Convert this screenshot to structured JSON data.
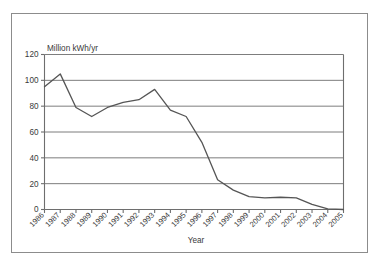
{
  "chart_data": {
    "type": "line",
    "title": "",
    "subtitle": "",
    "xlabel": "Year",
    "ylabel": "Million kWh/yr",
    "ylabel_position": "above-axis",
    "categories": [
      "1986",
      "1987",
      "1988",
      "1989",
      "1990",
      "1991",
      "1992",
      "1993",
      "1994",
      "1995",
      "1996",
      "1997",
      "1998",
      "1999",
      "2000",
      "2001",
      "2002",
      "2003",
      "2004",
      "2005"
    ],
    "values": [
      95,
      105,
      79,
      72,
      79,
      83,
      85,
      93,
      77,
      72,
      52,
      23,
      15,
      10,
      9,
      9.5,
      9,
      4,
      0.5,
      0
    ],
    "series": [
      {
        "name": "Electricity generation",
        "values": [
          95,
          105,
          79,
          72,
          79,
          83,
          85,
          93,
          77,
          72,
          52,
          23,
          15,
          10,
          9,
          9.5,
          9,
          4,
          0.5,
          0
        ],
        "color": "#555555"
      }
    ],
    "ylim": [
      0,
      120
    ],
    "yticks": [
      0,
      20,
      40,
      60,
      80,
      100,
      120
    ],
    "ytick_labels": [
      "0",
      "20",
      "40",
      "60",
      "80",
      "100",
      "120"
    ],
    "xtick_labels": [
      "1986",
      "1987",
      "1988",
      "1989",
      "1990",
      "1991",
      "1992",
      "1993",
      "1994",
      "1995",
      "1996",
      "1997",
      "1998",
      "1999",
      "2000",
      "2001",
      "2002",
      "2003",
      "2004",
      "2005"
    ],
    "xtick_rotation_deg": 45,
    "grid": {
      "horizontal": true,
      "vertical": false,
      "color": "#6e6e6e"
    },
    "legend": {
      "visible": false,
      "position": "none",
      "entries": []
    },
    "annotations": [],
    "frame": {
      "border_color": "#8c8c8c",
      "background_color": "#ffffff"
    },
    "axis": {
      "line_color": "#6e6e6e",
      "tick_color": "#6e6e6e"
    }
  }
}
